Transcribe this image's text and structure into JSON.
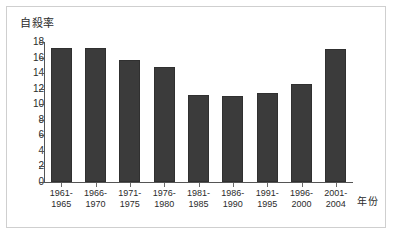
{
  "chart_data": {
    "type": "bar",
    "title": "",
    "subtitle": "",
    "ylabel": "自殺率",
    "xlabel": "年份",
    "ylim": [
      0,
      18
    ],
    "ytick_step": 2,
    "yticks": [
      "18",
      "16",
      "14",
      "12",
      "10",
      "8",
      "6",
      "4",
      "2",
      "0"
    ],
    "ytick_values": [
      18,
      16,
      14,
      12,
      10,
      8,
      6,
      4,
      2,
      0
    ],
    "grid": false,
    "legend": false,
    "legend_position": "none",
    "categories": [
      "1961-1965",
      "1966-1970",
      "1971-1975",
      "1976-1980",
      "1981-1985",
      "1986-1990",
      "1991-1995",
      "1996-2000",
      "2001-2004"
    ],
    "category_lines": [
      [
        "1961-",
        "1965"
      ],
      [
        "1966-",
        "1970"
      ],
      [
        "1971-",
        "1975"
      ],
      [
        "1976-",
        "1980"
      ],
      [
        "1981-",
        "1985"
      ],
      [
        "1986-",
        "1990"
      ],
      [
        "1991-",
        "1995"
      ],
      [
        "1996-",
        "2000"
      ],
      [
        "2001-",
        "2004"
      ]
    ],
    "values": [
      17.2,
      17.2,
      15.7,
      14.8,
      11.2,
      11.1,
      11.5,
      12.6,
      17.1
    ],
    "series": [
      {
        "name": "自殺率",
        "values": [
          17.2,
          17.2,
          15.7,
          14.8,
          11.2,
          11.1,
          11.5,
          12.6,
          17.1
        ]
      }
    ],
    "annotations": []
  },
  "style": {
    "bar_color": "#3b3b3b",
    "bar_edge_color": "#303030",
    "axis_color": "#555555",
    "text_color": "#2b2b2b",
    "frame_color": "#cfcfcf",
    "background_color": "#ffffff"
  }
}
